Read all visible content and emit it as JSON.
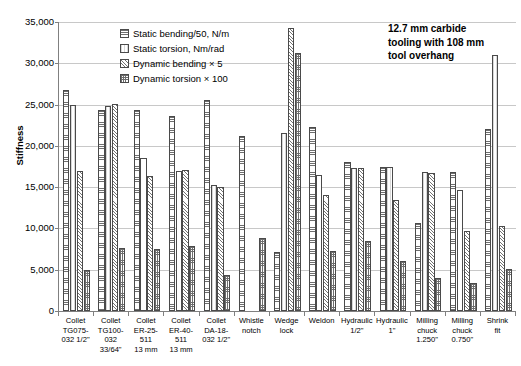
{
  "axes": {
    "ylabel": "Stiffness",
    "yticks": [
      "0",
      "5,000",
      "10,000",
      "15,000",
      "20,000",
      "25,000",
      "30,000",
      "35,000"
    ],
    "ymin": 0,
    "ymax": 35000,
    "ystep": 5000,
    "grid": true
  },
  "legend": {
    "position": "top-left-inside",
    "items": [
      {
        "label": "Static bending/50, N/m",
        "pattern": "horizontal-lines"
      },
      {
        "label": "Static torsion, Nm/rad",
        "pattern": "plain-light"
      },
      {
        "label": "Dynamic bending × 5",
        "pattern": "diagonal-hatch"
      },
      {
        "label": "Dynamic torsion × 100",
        "pattern": "cross-hatch"
      }
    ]
  },
  "annotation": {
    "line1": "12.7 mm carbide",
    "line2": "tooling with 108 mm",
    "line3": "tool overhang"
  },
  "chart_data": {
    "type": "bar",
    "title": "",
    "xlabel": "",
    "ylabel": "Stiffness",
    "ylim": [
      0,
      35000
    ],
    "yticks": [
      0,
      5000,
      10000,
      15000,
      20000,
      25000,
      30000,
      35000
    ],
    "grid": true,
    "legend_position": "upper left (inside plot)",
    "annotation": "12.7 mm carbide tooling with 108 mm tool overhang",
    "categories": [
      [
        "Collet",
        "TG075-",
        "032 1/2\""
      ],
      [
        "Collet",
        "TG100-",
        "032",
        "33/64\""
      ],
      [
        "Collet",
        "ER-25-",
        "511",
        "13 mm"
      ],
      [
        "Collet",
        "ER-40-",
        "511",
        "13 mm"
      ],
      [
        "Collet",
        "DA-18-",
        "032 1/2\""
      ],
      [
        "Whistle",
        "notch"
      ],
      [
        "Wedge",
        "lock"
      ],
      [
        "Weldon"
      ],
      [
        "Hydraulic",
        "1/2\""
      ],
      [
        "Hydraulic",
        "1\""
      ],
      [
        "Milling",
        "chuck",
        "1.250\""
      ],
      [
        "Milling",
        "chuck",
        "0.750\""
      ],
      [
        "Shrink",
        "fit"
      ]
    ],
    "category_labels_flat": [
      "Collet TG075-032 1/2\"",
      "Collet TG100-032 33/64\"",
      "Collet ER-25-511 13 mm",
      "Collet ER-40-511 13 mm",
      "Collet DA-18-032 1/2\"",
      "Whistle notch",
      "Wedge lock",
      "Weldon",
      "Hydraulic 1/2\"",
      "Hydraulic 1\"",
      "Milling chuck 1.250\"",
      "Milling chuck 0.750\"",
      "Shrink fit"
    ],
    "series": [
      {
        "name": "Static bending/50, N/m",
        "values": [
          26800,
          24400,
          24400,
          23600,
          25600,
          21200,
          7100,
          22300,
          18000,
          17500,
          10700,
          16800,
          22100
        ]
      },
      {
        "name": "Static torsion, Nm/rad",
        "values": [
          25000,
          24800,
          18500,
          17000,
          15300,
          null,
          21500,
          16500,
          17300,
          17500,
          16800,
          14600,
          31000
        ]
      },
      {
        "name": "Dynamic bending × 5",
        "values": [
          17000,
          25100,
          16400,
          17100,
          15000,
          null,
          34300,
          14100,
          17300,
          13500,
          16700,
          9700,
          10300
        ]
      },
      {
        "name": "Dynamic torsion × 100",
        "values": [
          5000,
          7600,
          7500,
          7900,
          4400,
          8900,
          31300,
          7300,
          8500,
          6100,
          4000,
          3400,
          5100
        ]
      }
    ]
  }
}
